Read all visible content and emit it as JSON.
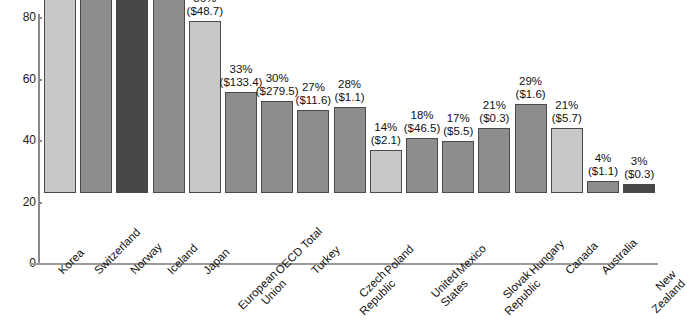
{
  "chart_data": {
    "type": "bar",
    "title": "",
    "subtitle": "",
    "xlabel": "",
    "ylabel": "",
    "ylim": [
      0,
      80
    ],
    "yticks": [
      0,
      20,
      40,
      60,
      80
    ],
    "ytick_labels": [
      "0",
      "20",
      "40",
      "60",
      "80"
    ],
    "grid": false,
    "legend": "none",
    "categories": [
      "Korea",
      "Switzerland",
      "Norway",
      "Iceland",
      "Japan",
      "European Union",
      "OECD Total",
      "Turkey",
      "Czech Republic",
      "Poland",
      "United States",
      "Mexico",
      "Slovak Republic",
      "Hungary",
      "Canada",
      "Australia",
      "New Zealand"
    ],
    "category_lines": [
      [
        "Korea"
      ],
      [
        "Switzerland"
      ],
      [
        "Norway"
      ],
      [
        "Iceland"
      ],
      [
        "Japan"
      ],
      [
        "European",
        "Union"
      ],
      [
        "OECD Total"
      ],
      [
        "Turkey"
      ],
      [
        "Czech",
        "Republic"
      ],
      [
        "Poland"
      ],
      [
        "United",
        "States"
      ],
      [
        "Mexico"
      ],
      [
        "Slovak",
        "Republic"
      ],
      [
        "Hungary"
      ],
      [
        "Canada"
      ],
      [
        "Australia"
      ],
      [
        "New",
        "Zealand"
      ]
    ],
    "values": [
      63,
      68,
      68,
      69,
      56,
      33,
      30,
      27,
      28,
      14,
      18,
      17,
      21,
      29,
      21,
      4,
      3
    ],
    "percent_labels": [
      "63%",
      "68%",
      "68%",
      "69%",
      "56%",
      "33%",
      "30%",
      "27%",
      "28%",
      "14%",
      "18%",
      "17%",
      "21%",
      "29%",
      "21%",
      "4%",
      "3%"
    ],
    "amount_labels": [
      "($19.8)",
      "($5.8)",
      "($3.0)",
      "($0.2)",
      "($48.7)",
      "($133.4)",
      "($279.5)",
      "($11.6)",
      "($1.1)",
      "($2.1)",
      "($46.5)",
      "($5.5)",
      "($0.3)",
      "($1.6)",
      "($5.7)",
      "($1.1)",
      "($0.3)"
    ],
    "bar_colors": [
      "#c8c8c8",
      "#8d8d8d",
      "#474747",
      "#8d8d8d",
      "#c8c8c8",
      "#8d8d8d",
      "#8d8d8d",
      "#8d8d8d",
      "#8d8d8d",
      "#c8c8c8",
      "#8d8d8d",
      "#8d8d8d",
      "#8d8d8d",
      "#8d8d8d",
      "#c8c8c8",
      "#8d8d8d",
      "#474747"
    ],
    "colors": {
      "light": "#c8c8c8",
      "medium": "#8d8d8d",
      "dark": "#474747",
      "axis": "#8a8a8a",
      "text": "#111111",
      "background": "#ffffff"
    }
  }
}
